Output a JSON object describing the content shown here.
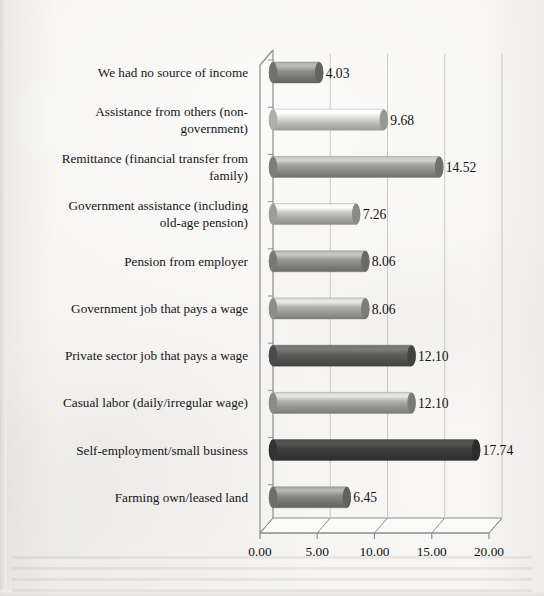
{
  "chart_data": {
    "type": "bar",
    "orientation": "horizontal",
    "style": "3d-cylinder",
    "title": "",
    "subtitle": "",
    "xlabel": "",
    "ylabel": "",
    "xlim": [
      0,
      20
    ],
    "xticks": [
      "0.00",
      "5.00",
      "10.00",
      "15.00",
      "20.00"
    ],
    "xtick_values": [
      0,
      5,
      10,
      15,
      20
    ],
    "grid": true,
    "legend": false,
    "value_label_format": "2dp",
    "categories": [
      "We had no source of income",
      "Assistance from others (non-government)",
      "Remittance (financial transfer from family)",
      "Government assistance (including old-age pension)",
      "Pension from employer",
      "Government job that pays a wage",
      "Private sector job that pays a wage",
      "Casual labor (daily/irregular wage)",
      "Self-employment/small business",
      "Farming own/leased land"
    ],
    "category_lines": [
      [
        "We had no source of income"
      ],
      [
        "Assistance from others (non-",
        "government)"
      ],
      [
        "Remittance (financial transfer from",
        "family)"
      ],
      [
        "Government assistance (including",
        "old-age pension)"
      ],
      [
        "Pension from employer"
      ],
      [
        "Government job that pays a wage"
      ],
      [
        "Private sector job that pays a wage"
      ],
      [
        "Casual labor (daily/irregular wage)"
      ],
      [
        "Self-employment/small business"
      ],
      [
        "Farming own/leased land"
      ]
    ],
    "values": [
      4.03,
      9.68,
      14.52,
      7.26,
      8.06,
      8.06,
      12.1,
      12.1,
      17.74,
      6.45
    ],
    "value_labels": [
      "4.03",
      "9.68",
      "14.52",
      "7.26",
      "8.06",
      "8.06",
      "12.10",
      "12.10",
      "17.74",
      "6.45"
    ],
    "bar_colors": [
      "#8d8d8b",
      "#d9d9d6",
      "#9e9e9b",
      "#c4c4c1",
      "#969694",
      "#b0b0ad",
      "#5d5d5c",
      "#aeaeab",
      "#3f3f3e",
      "#8a8a88"
    ]
  },
  "colors": {
    "axis": "#8c8c8c",
    "grid": "#c8c8c6",
    "text": "#111111",
    "paper": "#f4f3f1"
  }
}
